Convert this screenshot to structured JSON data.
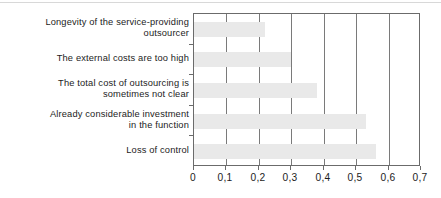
{
  "chart_data": {
    "type": "bar",
    "orientation": "horizontal",
    "title": "",
    "subtitle": "",
    "xlabel": "",
    "ylabel": "",
    "categories": [
      "Longevity of the service-providing\noutsourcer",
      "The external costs are too high",
      "The total cost of outsourcing is\nsometimes not clear",
      "Already considerable investment\nin the function",
      "Loss of control"
    ],
    "values": [
      0.22,
      0.3,
      0.38,
      0.53,
      0.56
    ],
    "xlim": [
      0,
      0.7
    ],
    "xticks": [
      0,
      0.1,
      0.2,
      0.3,
      0.4,
      0.5,
      0.6,
      0.7
    ],
    "xticklabels": [
      "0",
      "0,1",
      "0,2",
      "0,3",
      "0,4",
      "0,5",
      "0,6",
      "0,7"
    ],
    "grid": "vertical",
    "legend": "none",
    "bar_color": "#e9e9e9",
    "axis_color": "#6b6b6b",
    "gridline_color": "#7a7a7a",
    "text_color": "#1c1c1c",
    "background": "#ffffff"
  }
}
